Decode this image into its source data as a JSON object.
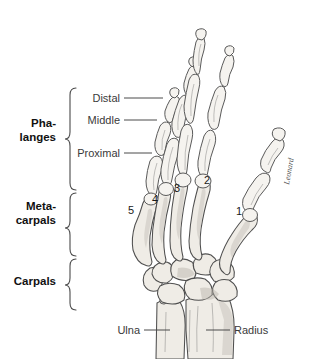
{
  "figure": {
    "background_color": "#ffffff",
    "bone_fill": "#efece6",
    "outline_color": "#4f4f4f",
    "label_color": "#3a3a3a"
  },
  "group_labels": [
    {
      "id": "phalanges",
      "line1": "Pha-",
      "line2": "langes"
    },
    {
      "id": "metacarpals",
      "line1": "Meta-",
      "line2": "carpals"
    },
    {
      "id": "carpals",
      "line1": "Carpals",
      "line2": ""
    }
  ],
  "phalanx_labels": [
    {
      "id": "distal",
      "text": "Distal"
    },
    {
      "id": "middle",
      "text": "Middle"
    },
    {
      "id": "proximal",
      "text": "Proximal"
    }
  ],
  "digit_numbers": [
    {
      "id": "digit-1",
      "text": "1"
    },
    {
      "id": "digit-2",
      "text": "2"
    },
    {
      "id": "digit-3",
      "text": "3"
    },
    {
      "id": "digit-4",
      "text": "4"
    },
    {
      "id": "digit-5",
      "text": "5"
    }
  ],
  "forearm_labels": [
    {
      "id": "ulna",
      "text": "Ulna"
    },
    {
      "id": "radius",
      "text": "Radius"
    }
  ],
  "signature": {
    "text": "Leonard"
  }
}
